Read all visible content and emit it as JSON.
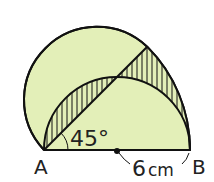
{
  "diagram": {
    "type": "geometry",
    "points": {
      "A": "A",
      "B": "B"
    },
    "angle_label": "45°",
    "length_label": "6cm",
    "length_value": "6",
    "length_unit": "cm",
    "colors": {
      "fill": "#e3efb8",
      "stroke": "#111111",
      "hatch": "#111111",
      "background": "#ffffff"
    }
  }
}
